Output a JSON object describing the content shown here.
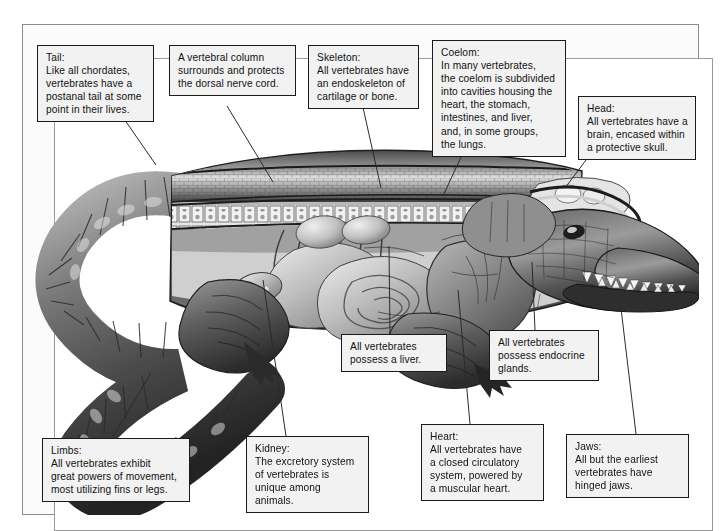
{
  "figure": {
    "illustration_alt": "Grayscale anatomical cutaway drawing of a crocodile showing vertebral column, ribs, internal organs, limbs and curved tail"
  },
  "callouts": [
    {
      "id": "tail",
      "name": "callout-tail",
      "text": "Tail:\nLike all chordates,\nvertebrates have a\npostanal tail at some\npoint in their lives."
    },
    {
      "id": "vertebral-column",
      "name": "callout-vertebral-column",
      "text": "A vertebral column\nsurrounds and protects\nthe dorsal nerve cord."
    },
    {
      "id": "skeleton",
      "name": "callout-skeleton",
      "text": "Skeleton:\nAll vertebrates have\nan endoskeleton of\ncartilage or bone."
    },
    {
      "id": "coelom",
      "name": "callout-coelom",
      "text": "Coelom:\nIn many vertebrates,\nthe coelom is subdivided\ninto cavities housing the\nheart, the stomach,\nintestines, and liver,\nand, in some groups,\nthe lungs."
    },
    {
      "id": "head",
      "name": "callout-head",
      "text": "Head:\nAll vertebrates have a\nbrain, encased within\na protective skull."
    },
    {
      "id": "liver",
      "name": "callout-liver",
      "text": "All vertebrates\npossess a liver."
    },
    {
      "id": "endocrine",
      "name": "callout-endocrine",
      "text": "All vertebrates\npossess endocrine\nglands."
    },
    {
      "id": "limbs",
      "name": "callout-limbs",
      "text": "Limbs:\nAll vertebrates exhibit\ngreat powers of movement,\nmost utilizing fins or legs."
    },
    {
      "id": "kidney",
      "name": "callout-kidney",
      "text": "Kidney:\nThe excretory system\nof vertebrates is\nunique among animals."
    },
    {
      "id": "heart",
      "name": "callout-heart",
      "text": "Heart:\nAll vertebrates have\na closed circulatory\nsystem, powered by\na muscular heart."
    },
    {
      "id": "jaws",
      "name": "callout-jaws",
      "text": "Jaws:\nAll but the earliest\nvertebrates have\nhinged jaws."
    }
  ],
  "colors": {
    "page_background": "#ffffff",
    "frame_border": "#8c8c8c",
    "inner_border": "#9a9a9a",
    "callout_fill": "#f2f2f2",
    "callout_border": "#1a1a1a",
    "text": "#111111",
    "leader_line": "#2b2b2b",
    "illustration_dark": "#2a2a2a",
    "illustration_mid": "#7d7d7d",
    "illustration_light": "#d8d8d8"
  }
}
